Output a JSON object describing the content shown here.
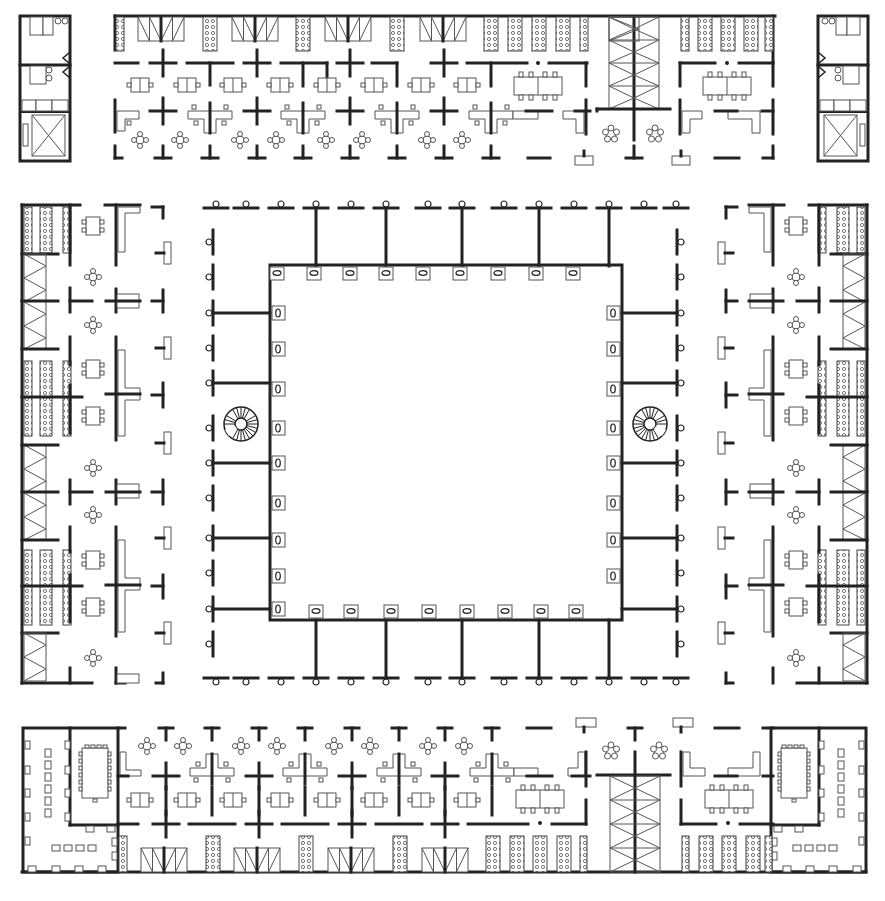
{
  "drawing": {
    "type": "architectural floor plan",
    "colors": {
      "background": "#ffffff",
      "walls": "#222222",
      "furniture": "#555555"
    },
    "sections": {
      "top_left_core": {
        "x": 20,
        "y": 16,
        "w": 50,
        "h": 145
      },
      "top_right_core": {
        "x": 818,
        "y": 16,
        "w": 50,
        "h": 145
      },
      "top_wing": {
        "x": 115,
        "y": 16,
        "w": 660,
        "h": 142
      },
      "bottom_wing": {
        "x": 22,
        "y": 728,
        "w": 845,
        "h": 145
      },
      "left_wing": {
        "x": 22,
        "y": 205,
        "w": 145,
        "h": 478
      },
      "right_wing": {
        "x": 722,
        "y": 205,
        "w": 145,
        "h": 478
      },
      "atrium_outer": {
        "x": 211,
        "y": 207,
        "w": 470,
        "h": 472
      },
      "atrium_inner": {
        "x": 270,
        "y": 265,
        "w": 352,
        "h": 355
      }
    },
    "counts": {
      "atrium_inner_columns_per_side": 9,
      "spiral_stairs": 2,
      "conference_rooms": 2,
      "stair_towers": 2,
      "elevators": 2
    }
  }
}
